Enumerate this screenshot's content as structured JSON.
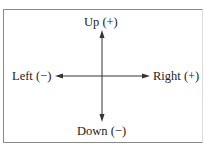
{
  "diagram": {
    "up": "Up (+)",
    "down": "Down (−)",
    "left": "Left (−)",
    "right": "Right (+)"
  }
}
